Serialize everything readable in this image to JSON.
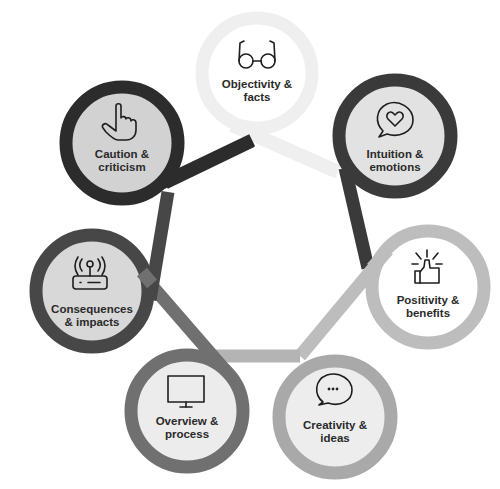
{
  "diagram": {
    "type": "six-thinking-hats-cycle",
    "nodes": [
      {
        "id": "objectivity",
        "line1": "Objectivity &",
        "line2": "facts",
        "icon": "glasses-icon",
        "ring_color": "#efefef",
        "fill_color": "#ffffff"
      },
      {
        "id": "intuition",
        "line1": "Intuition &",
        "line2": "emotions",
        "icon": "heart-speech-bubble-icon",
        "ring_color": "#3a3a3a",
        "fill_color": "#e2e2e2"
      },
      {
        "id": "positivity",
        "line1": "Positivity &",
        "line2": "benefits",
        "icon": "thumbs-up-icon",
        "ring_color": "#bdbdbd",
        "fill_color": "#ffffff"
      },
      {
        "id": "creativity",
        "line1": "Creativity &",
        "line2": "ideas",
        "icon": "speech-bubble-dots-icon",
        "ring_color": "#a9a9a9",
        "fill_color": "#ededed"
      },
      {
        "id": "overview",
        "line1": "Overview &",
        "line2": "process",
        "icon": "monitor-icon",
        "ring_color": "#707070",
        "fill_color": "#ececec"
      },
      {
        "id": "consequences",
        "line1": "Consequences",
        "line2": "& impacts",
        "icon": "router-icon",
        "ring_color": "#474747",
        "fill_color": "#d8d8d8"
      },
      {
        "id": "caution",
        "line1": "Caution &",
        "line2": "criticism",
        "icon": "pointing-hand-icon",
        "ring_color": "#2c2c2c",
        "fill_color": "#d2d2d2"
      }
    ]
  }
}
